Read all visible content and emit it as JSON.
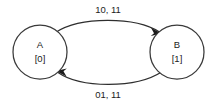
{
  "diagram": {
    "type": "state-transition-diagram",
    "background_color": "#ffffff",
    "stroke_color": "#2e2e2e",
    "text_color": "#1c1c1c",
    "nodes": [
      {
        "id": "A",
        "label": "A",
        "sublabel": "[0]",
        "cx": 40,
        "cy": 52,
        "r": 27
      },
      {
        "id": "B",
        "label": "B",
        "sublabel": "[1]",
        "cx": 177,
        "cy": 52,
        "r": 27
      }
    ],
    "edges": [
      {
        "id": "a-to-b",
        "from": "A",
        "to": "B",
        "label": "10, 11",
        "label_x": 108,
        "label_y": 10,
        "direction": "top-arc-left-to-right"
      },
      {
        "id": "b-to-a",
        "from": "B",
        "to": "A",
        "label": "01, 11",
        "label_x": 108,
        "label_y": 95,
        "direction": "bottom-arc-right-to-left"
      }
    ]
  }
}
